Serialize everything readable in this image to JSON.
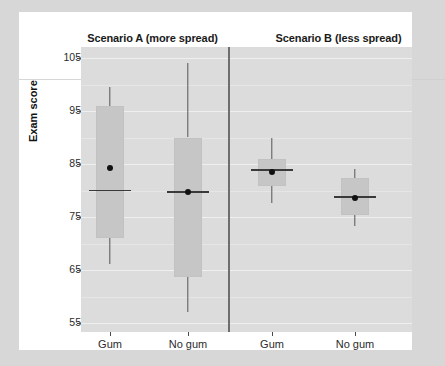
{
  "figure": {
    "y_axis_title": "Exam score",
    "panels": [
      {
        "title": "Scenario A (more spread)"
      },
      {
        "title": "Scenario B (less spread)"
      }
    ]
  },
  "chart_data": {
    "type": "box",
    "title": "",
    "subtitle": "",
    "xlabel": "",
    "ylabel": "Exam score",
    "ylim": [
      54,
      107
    ],
    "yticks": [
      55,
      65,
      75,
      85,
      95,
      105
    ],
    "ytick_labels": [
      "55",
      "65",
      "75",
      "85",
      "95",
      "105"
    ],
    "xtick_labels": [
      "Gum",
      "No gum",
      "Gum",
      "No gum"
    ],
    "grid": true,
    "legend": "none",
    "facets": [
      "Scenario A (more spread)",
      "Scenario B (less spread)"
    ],
    "panel_colors": {
      "panel_background": "#dcdcdc",
      "box_fill": "#c6c6c6",
      "line": "#555555",
      "mean_marker": "#111111"
    },
    "boxes": [
      {
        "panel": "Scenario A (more spread)",
        "category": "Gum",
        "whisker_low": 66.2,
        "q1": 71.1,
        "median": 80.0,
        "q3": 96.0,
        "whisker_high": 99.6,
        "mean": 84.2
      },
      {
        "panel": "Scenario A (more spread)",
        "category": "No gum",
        "whisker_low": 57.0,
        "q1": 63.7,
        "median": 79.7,
        "q3": 90.0,
        "whisker_high": 104.0,
        "mean": 79.7
      },
      {
        "panel": "Scenario B (less spread)",
        "category": "Gum",
        "whisker_low": 77.6,
        "q1": 80.8,
        "median": 83.9,
        "q3": 86.0,
        "whisker_high": 90.0,
        "mean": 83.5
      },
      {
        "panel": "Scenario B (less spread)",
        "category": "No gum",
        "whisker_low": 73.3,
        "q1": 75.4,
        "median": 78.8,
        "q3": 82.4,
        "whisker_high": 84.0,
        "mean": 78.6
      }
    ]
  }
}
